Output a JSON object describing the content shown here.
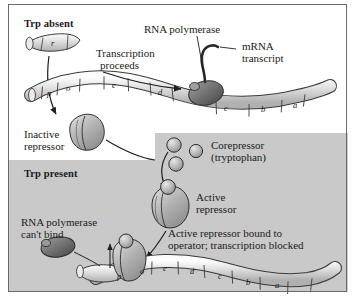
{
  "figure": {
    "panels": {
      "top": {
        "header": "Trp absent"
      },
      "bottom": {
        "header": "Trp present"
      }
    }
  },
  "colors": {
    "page_background": "#ffffff",
    "panel_gray": "#c9c9c9",
    "dna_fill": "#d6d6d6",
    "dna_outline": "#3a3a3a",
    "polymerase_fill": "#7d7d7d",
    "repressor_fill": "#a8a8a8",
    "corepressor_fill": "#b4b4b4",
    "text": "#1a1a1a"
  },
  "top_panel": {
    "header": "Trp absent",
    "regulatory_gene_label": "r",
    "transcription_label_line1": "Transcription",
    "transcription_label_line2": "proceeds",
    "polymerase_label": "RNA polymerase",
    "mrna_label_line1": "mRNA",
    "mrna_label_line2": "transcript",
    "inactive_repressor_line1": "Inactive",
    "inactive_repressor_line2": "repressor",
    "dna_genes": [
      "p",
      "o",
      "e",
      "d",
      "c",
      "b",
      "a"
    ]
  },
  "corepressor_inset": {
    "label_line1": "Corepressor",
    "label_line2": "(tryptophan)",
    "molecule_count": 3
  },
  "bottom_panel": {
    "header": "Trp present",
    "active_repressor_line1": "Active",
    "active_repressor_line2": "repressor",
    "polymerase_blocked_line1": "RNA polymerase",
    "polymerase_blocked_line2": "can't bind",
    "bound_note_line1": "Active repressor bound to",
    "bound_note_line2": "operator; transcription blocked",
    "dna_genes": [
      "p",
      "o",
      "e",
      "d",
      "c",
      "b",
      "a"
    ]
  }
}
